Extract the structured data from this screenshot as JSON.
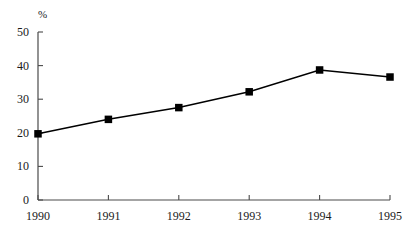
{
  "chart_data": {
    "type": "line",
    "title": "",
    "subtitle": "",
    "xlabel": "",
    "ylabel": "%",
    "unit_label": "%",
    "categories": [
      "1990",
      "1991",
      "1992",
      "1993",
      "1994",
      "1995"
    ],
    "x": [
      1990,
      1991,
      1992,
      1993,
      1994,
      1995
    ],
    "values": [
      19.7,
      24.0,
      27.5,
      32.2,
      38.7,
      36.6
    ],
    "series": [
      {
        "name": "",
        "values": [
          19.7,
          24.0,
          27.5,
          32.2,
          38.7,
          36.6
        ],
        "color": "#000000",
        "marker": "square",
        "marker_color": "#000000"
      }
    ],
    "ylim": [
      0,
      50
    ],
    "yticks": [
      0,
      10,
      20,
      30,
      40,
      50
    ],
    "ytick_labels": [
      "0",
      "10",
      "20",
      "30",
      "40",
      "50"
    ],
    "xtick_labels": [
      "1990",
      "1991",
      "1992",
      "1993",
      "1994",
      "1995"
    ],
    "grid": false,
    "legend": false,
    "legend_position": "none",
    "axis_color": "#4a4a4a",
    "line_color": "#000000",
    "background": "#ffffff"
  },
  "geometry": {
    "plot_left": 38,
    "plot_right": 390,
    "plot_top": 32,
    "plot_bottom": 200,
    "unit_label_x": 38,
    "unit_label_y": 8
  }
}
